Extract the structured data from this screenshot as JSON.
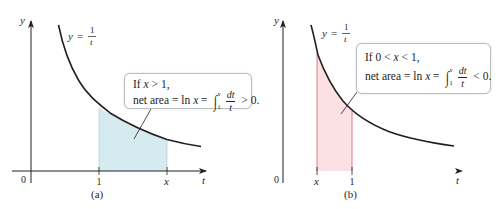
{
  "figure": {
    "colors": {
      "curve": "#231f20",
      "axis": "#231f20",
      "shade_positive": "#d6ebef",
      "shade_negative": "#fbe1e4",
      "bound_line_negative": "#d2757f",
      "callout_border": "#b9bdbf"
    },
    "panels": [
      {
        "id": "a",
        "caption": "(a)",
        "curve_label": {
          "lhs": "y",
          "eq": "=",
          "num": "1",
          "den": "t"
        },
        "axes": {
          "x_label": "t",
          "y_label": "y",
          "origin_label": "0"
        },
        "ticks": [
          {
            "label": "1",
            "italic": false
          },
          {
            "label": "x",
            "italic": true
          }
        ],
        "shaded_interval": {
          "from": 1,
          "to": 2,
          "sign": "positive"
        },
        "callout": {
          "line1": {
            "text": "If ",
            "var": "x",
            "rest": " > 1,"
          },
          "line2": {
            "prefix": "net area = ln ",
            "var": "x",
            "eq": " = ",
            "integral": {
              "lower": "1",
              "upper": "x",
              "num": "dt",
              "den": "t"
            },
            "suffix": " > 0."
          }
        }
      },
      {
        "id": "b",
        "caption": "(b)",
        "curve_label": {
          "lhs": "y",
          "eq": "=",
          "num": "1",
          "den": "t"
        },
        "axes": {
          "x_label": "t",
          "y_label": "y",
          "origin_label": "0"
        },
        "ticks": [
          {
            "label": "x",
            "italic": true
          },
          {
            "label": "1",
            "italic": false
          }
        ],
        "shaded_interval": {
          "from": 0.5,
          "to": 1,
          "sign": "negative"
        },
        "callout": {
          "line1": {
            "text": "If 0 < ",
            "var": "x",
            "rest": " < 1,"
          },
          "line2": {
            "prefix": "net area = ln ",
            "var": "x",
            "eq": " = ",
            "integral": {
              "lower": "1",
              "upper": "x",
              "num": "dt",
              "den": "t"
            },
            "suffix": " < 0."
          }
        }
      }
    ]
  }
}
